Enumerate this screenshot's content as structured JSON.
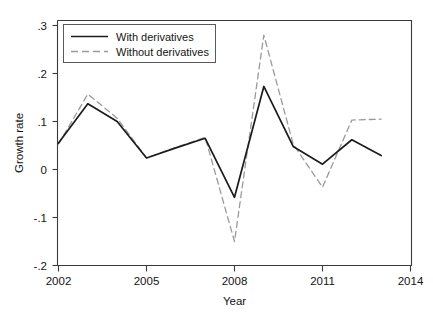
{
  "chart_data": {
    "type": "line",
    "title": "",
    "xlabel": "Year",
    "ylabel": "Growth rate",
    "xlim": [
      2002,
      2014
    ],
    "ylim": [
      -0.2,
      0.3
    ],
    "xticks": [
      2002,
      2005,
      2008,
      2011,
      2014
    ],
    "xticklabels": [
      "2002",
      "2005",
      "2008",
      "2011",
      "2014"
    ],
    "yticks": [
      0.3,
      0.2,
      0.1,
      0,
      -0.1,
      -0.2
    ],
    "yticklabels": [
      ".3",
      ".2",
      ".1",
      "0",
      "-.1",
      "-.2"
    ],
    "grid": false,
    "legend_position": "top-left",
    "x": [
      2002,
      2003,
      2004,
      2005,
      2006,
      2007,
      2008,
      2009,
      2010,
      2011,
      2012,
      2013
    ],
    "series": [
      {
        "name": "With derivatives",
        "style": "solid",
        "color": "#1c1c1c",
        "values": [
          0.055,
          0.137,
          0.1,
          0.024,
          0.045,
          0.065,
          -0.058,
          0.173,
          0.048,
          0.011,
          0.062,
          0.029
        ]
      },
      {
        "name": "Without derivatives",
        "style": "dashed",
        "color": "#9a9a9a",
        "values": [
          0.053,
          0.157,
          0.107,
          0.024,
          0.046,
          0.067,
          -0.15,
          0.28,
          0.053,
          -0.037,
          0.103,
          0.105
        ]
      }
    ]
  },
  "axes": {
    "y_title": "Growth rate",
    "x_title": "Year"
  },
  "legend": {
    "items": [
      {
        "label": "With derivatives",
        "style": "solid"
      },
      {
        "label": "Without derivatives",
        "style": "dashed"
      }
    ]
  }
}
